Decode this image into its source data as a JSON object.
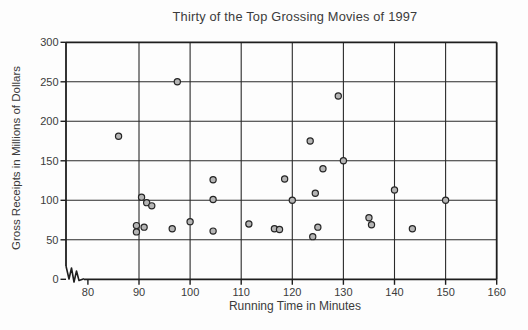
{
  "chart_data": {
    "type": "scatter",
    "title": "Thirty of the Top Grossing Movies of 1997",
    "xlabel": "Running Time in Minutes",
    "ylabel": "Gross Receipts in Millions of Dollars",
    "xlim": [
      80,
      160
    ],
    "ylim": [
      0,
      300
    ],
    "x_axis_break_before_min": true,
    "x_ticks": [
      80,
      90,
      100,
      110,
      120,
      130,
      140,
      150,
      160
    ],
    "y_ticks": [
      0,
      50,
      100,
      150,
      200,
      250,
      300
    ],
    "x_gridlines": [
      90,
      100,
      110,
      120,
      130,
      140,
      150
    ],
    "y_gridlines": [
      50,
      100,
      150,
      200,
      250
    ],
    "grid": true,
    "points": [
      [
        86,
        181
      ],
      [
        89.5,
        68
      ],
      [
        89.5,
        60
      ],
      [
        90.5,
        104
      ],
      [
        91,
        66
      ],
      [
        91.5,
        97
      ],
      [
        92.5,
        93
      ],
      [
        96.5,
        64
      ],
      [
        97.5,
        250
      ],
      [
        100,
        73
      ],
      [
        104.5,
        61
      ],
      [
        104.5,
        101
      ],
      [
        104.5,
        126
      ],
      [
        111.5,
        70
      ],
      [
        116.5,
        64
      ],
      [
        117.5,
        63
      ],
      [
        118.5,
        127
      ],
      [
        120,
        100
      ],
      [
        123.5,
        175
      ],
      [
        124,
        54
      ],
      [
        124.5,
        109
      ],
      [
        125,
        66
      ],
      [
        126,
        140
      ],
      [
        129,
        232
      ],
      [
        130,
        150
      ],
      [
        135,
        78
      ],
      [
        135.5,
        69
      ],
      [
        140,
        113
      ],
      [
        143.5,
        64
      ],
      [
        150,
        100
      ]
    ]
  },
  "colors": {
    "line": "#1e1e1e",
    "grid": "#2a2a2a",
    "text": "#3b3b3b",
    "point_fill": "#b5b5b5",
    "point_stroke": "#252525",
    "background": "#fdfdfd"
  }
}
